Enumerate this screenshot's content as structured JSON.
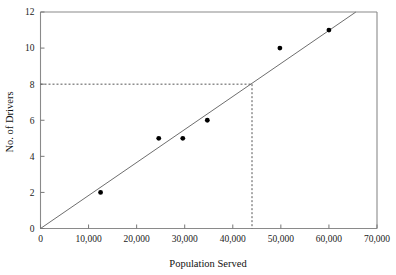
{
  "chart_data": {
    "type": "scatter",
    "title": "",
    "subtitle": "",
    "xlabel": "Population Served",
    "ylabel": "No. of Drivers",
    "xlim": [
      0,
      70000
    ],
    "ylim": [
      0,
      12
    ],
    "grid": false,
    "legend": null,
    "x_ticks": [
      0,
      10000,
      20000,
      30000,
      40000,
      50000,
      60000,
      70000
    ],
    "x_tick_labels": [
      "0",
      "10,000",
      "20,000",
      "30,000",
      "40,000",
      "50,000",
      "60,000",
      "70,000"
    ],
    "y_ticks": [
      0,
      2,
      4,
      6,
      8,
      10,
      12
    ],
    "y_tick_labels": [
      "0",
      "2",
      "4",
      "6",
      "8",
      "10",
      "12"
    ],
    "series": [
      {
        "name": "Observations",
        "type": "scatter",
        "marker": "filled-circle",
        "color": "#000000",
        "points": [
          {
            "x": 12500,
            "y": 2
          },
          {
            "x": 24600,
            "y": 5
          },
          {
            "x": 29600,
            "y": 5
          },
          {
            "x": 34700,
            "y": 6
          },
          {
            "x": 49800,
            "y": 10
          },
          {
            "x": 60000,
            "y": 11
          }
        ]
      },
      {
        "name": "Trend line",
        "type": "line",
        "color": "#6e6e6e",
        "points": [
          {
            "x": 0,
            "y": 0
          },
          {
            "x": 65600,
            "y": 12
          }
        ]
      }
    ],
    "annotations": [
      {
        "name": "guide-horizontal",
        "type": "dashed-line",
        "from": {
          "x": 0,
          "y": 8
        },
        "to": {
          "x": 44000,
          "y": 8
        }
      },
      {
        "name": "guide-vertical",
        "type": "dashed-line",
        "from": {
          "x": 44000,
          "y": 8
        },
        "to": {
          "x": 44000,
          "y": 0
        }
      }
    ]
  },
  "axes": {
    "x_title": "Population Served",
    "y_title": "No. of Drivers"
  },
  "colors": {
    "background": "#ffffff",
    "frame": "#8a8a8a",
    "marker": "#000000",
    "trend": "#6e6e6e",
    "guide": "#555555",
    "text": "#111111"
  }
}
